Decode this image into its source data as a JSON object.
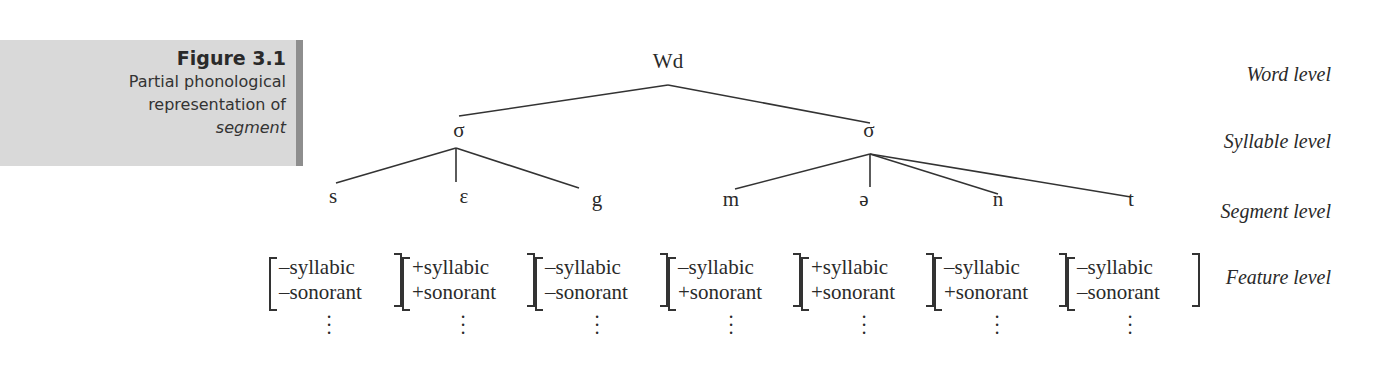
{
  "caption": {
    "figure_number": "Figure 3.1",
    "title_lines": [
      "Partial phonological",
      "representation of"
    ],
    "title_italic": "segment"
  },
  "tree": {
    "word_node": "Wd",
    "syllable_nodes": [
      "σ",
      "σ"
    ],
    "segments": [
      "s",
      "ɛ",
      "g",
      "m",
      "ə",
      "n",
      "t"
    ]
  },
  "levels": {
    "word": "Word level",
    "syllable": "Syllable level",
    "segment": "Segment level",
    "feature": "Feature level"
  },
  "features": [
    {
      "syllabic": "–syllabic",
      "sonorant": "–sonorant"
    },
    {
      "syllabic": "+syllabic",
      "sonorant": "+sonorant"
    },
    {
      "syllabic": "–syllabic",
      "sonorant": "–sonorant"
    },
    {
      "syllabic": "–syllabic",
      "sonorant": "+sonorant"
    },
    {
      "syllabic": "+syllabic",
      "sonorant": "+sonorant"
    },
    {
      "syllabic": "–syllabic",
      "sonorant": "+sonorant"
    },
    {
      "syllabic": "–syllabic",
      "sonorant": "–sonorant"
    }
  ],
  "ellipsis": "⋮",
  "colors": {
    "caption_bg": "#d9d9d9",
    "caption_border": "#8e8e8e",
    "ink": "#2a2a2a"
  }
}
